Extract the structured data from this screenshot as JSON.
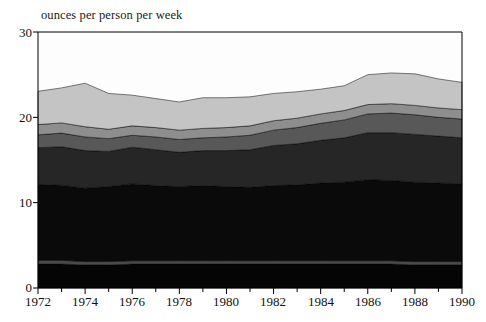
{
  "chart_data": {
    "type": "area",
    "title": "ounces per person per week",
    "xlabel": "",
    "ylabel": "",
    "ylim": [
      0,
      30
    ],
    "xlim": [
      1972,
      1990
    ],
    "yticks": [
      0,
      10,
      20,
      30
    ],
    "xticks": [
      1972,
      1974,
      1976,
      1978,
      1980,
      1982,
      1984,
      1986,
      1988,
      1990
    ],
    "xtick_minor_step": 1,
    "grid": false,
    "legend": "none",
    "stacked": true,
    "x": [
      1972,
      1973,
      1974,
      1975,
      1976,
      1977,
      1978,
      1979,
      1980,
      1981,
      1982,
      1983,
      1984,
      1985,
      1986,
      1987,
      1988,
      1989,
      1990
    ],
    "series": [
      {
        "name": "layer-1",
        "color": "#050505",
        "values": [
          2.8,
          2.8,
          2.7,
          2.7,
          2.8,
          2.8,
          2.8,
          2.8,
          2.8,
          2.8,
          2.8,
          2.8,
          2.8,
          2.8,
          2.8,
          2.8,
          2.7,
          2.7,
          2.7
        ]
      },
      {
        "name": "layer-2",
        "color": "#4a4a4a",
        "values": [
          0.45,
          0.45,
          0.4,
          0.4,
          0.4,
          0.4,
          0.4,
          0.4,
          0.4,
          0.4,
          0.4,
          0.4,
          0.4,
          0.4,
          0.4,
          0.4,
          0.4,
          0.4,
          0.4
        ]
      },
      {
        "name": "layer-3",
        "color": "#0a0a0a",
        "values": [
          8.9,
          8.8,
          8.6,
          8.8,
          9.0,
          8.8,
          8.7,
          8.8,
          8.7,
          8.6,
          8.8,
          8.9,
          9.1,
          9.2,
          9.5,
          9.4,
          9.3,
          9.2,
          9.1
        ]
      },
      {
        "name": "layer-4",
        "color": "#262626",
        "values": [
          4.3,
          4.5,
          4.4,
          4.1,
          4.3,
          4.2,
          4.0,
          4.1,
          4.2,
          4.4,
          4.7,
          4.8,
          5.0,
          5.2,
          5.5,
          5.6,
          5.6,
          5.5,
          5.4
        ]
      },
      {
        "name": "layer-5",
        "color": "#585858",
        "values": [
          1.5,
          1.6,
          1.6,
          1.5,
          1.4,
          1.5,
          1.5,
          1.5,
          1.6,
          1.7,
          1.8,
          1.9,
          2.0,
          2.1,
          2.2,
          2.3,
          2.3,
          2.2,
          2.2
        ]
      },
      {
        "name": "layer-6",
        "color": "#8e8e8e",
        "values": [
          1.2,
          1.2,
          1.2,
          1.1,
          1.1,
          1.1,
          1.1,
          1.1,
          1.1,
          1.1,
          1.1,
          1.1,
          1.1,
          1.1,
          1.1,
          1.1,
          1.1,
          1.1,
          1.1
        ]
      },
      {
        "name": "layer-7",
        "color": "#c4c4c4",
        "values": [
          3.9,
          4.1,
          5.1,
          4.2,
          3.6,
          3.4,
          3.3,
          3.6,
          3.5,
          3.4,
          3.2,
          3.1,
          2.9,
          2.9,
          3.5,
          3.6,
          3.7,
          3.4,
          3.2
        ]
      }
    ],
    "totals": [
      23.05,
      23.45,
      24.0,
      22.8,
      22.6,
      22.2,
      21.8,
      22.3,
      22.3,
      22.4,
      22.8,
      23.0,
      23.3,
      23.7,
      25.0,
      25.2,
      25.1,
      24.5,
      24.1
    ]
  },
  "axis": {
    "y_tick_labels": [
      "0",
      "10",
      "20",
      "30"
    ],
    "x_tick_labels": [
      "1972",
      "1974",
      "1976",
      "1978",
      "1980",
      "1982",
      "1984",
      "1986",
      "1988",
      "1990"
    ]
  }
}
